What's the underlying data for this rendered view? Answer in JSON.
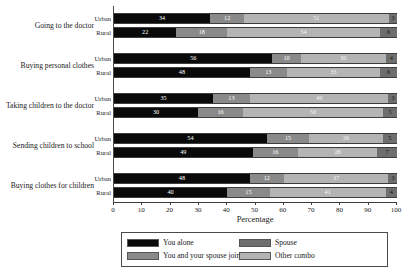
{
  "chart_data": {
    "type": "bar",
    "subtype": "stacked-horizontal-100pct",
    "title": "",
    "xlabel": "Percentage",
    "ylabel": "",
    "xlim": [
      0,
      100
    ],
    "xticks": [
      0,
      10,
      20,
      30,
      40,
      50,
      60,
      70,
      80,
      90,
      100
    ],
    "grid": false,
    "legend_position": "bottom",
    "series": [
      {
        "name": "You alone",
        "color": "#0a0a0a"
      },
      {
        "name": "You and your spouse jointly",
        "color": "#8a8a8a"
      },
      {
        "name": "Spouse",
        "color": "#6e6e6e"
      },
      {
        "name": "Other combo",
        "color": "#b4b4b4"
      }
    ],
    "legend_order_displayed": [
      "You alone",
      "Spouse",
      "You and your spouse jointly",
      "Other combo"
    ],
    "categories": [
      "Going to the doctor",
      "Buying personal clothes",
      "Taking children to the doctor",
      "Sending children to school",
      "Buying clothes for children"
    ],
    "subgroups": [
      "Urban",
      "Rural"
    ],
    "segment_stack_order": [
      "You alone",
      "You and your spouse jointly",
      "Other combo",
      "Spouse"
    ],
    "rows": [
      {
        "category": "Going to the doctor",
        "subgroup": "Urban",
        "values": [
          34,
          12,
          51,
          3
        ]
      },
      {
        "category": "Going to the doctor",
        "subgroup": "Rural",
        "values": [
          22,
          18,
          54,
          6
        ]
      },
      {
        "category": "Buying personal clothes",
        "subgroup": "Urban",
        "values": [
          56,
          10,
          30,
          4
        ]
      },
      {
        "category": "Buying personal clothes",
        "subgroup": "Rural",
        "values": [
          48,
          13,
          33,
          6
        ]
      },
      {
        "category": "Taking children to the doctor",
        "subgroup": "Urban",
        "values": [
          35,
          13,
          49,
          3
        ]
      },
      {
        "category": "Taking children to the doctor",
        "subgroup": "Rural",
        "values": [
          30,
          16,
          50,
          5
        ]
      },
      {
        "category": "Sending children to school",
        "subgroup": "Urban",
        "values": [
          54,
          15,
          26,
          5
        ]
      },
      {
        "category": "Sending children to school",
        "subgroup": "Rural",
        "values": [
          49,
          16,
          28,
          7
        ]
      },
      {
        "category": "Buying clothes for children",
        "subgroup": "Urban",
        "values": [
          48,
          12,
          37,
          3
        ]
      },
      {
        "category": "Buying clothes for children",
        "subgroup": "Rural",
        "values": [
          40,
          15,
          41,
          4
        ]
      }
    ]
  },
  "axis": {
    "title": "Percentage",
    "ticks": [
      "0",
      "10",
      "20",
      "30",
      "40",
      "50",
      "60",
      "70",
      "80",
      "90",
      "100"
    ]
  },
  "legend": {
    "items": [
      {
        "label": "You alone",
        "swatch": "sw0"
      },
      {
        "label": "Spouse",
        "swatch": "sw2"
      },
      {
        "label": "You and your spouse jointly",
        "swatch": "sw1"
      },
      {
        "label": "Other combo",
        "swatch": "sw3"
      }
    ]
  },
  "colors": {
    "you_alone": "#0a0a0a",
    "jointly": "#8a8a8a",
    "spouse": "#6e6e6e",
    "other_combo": "#b4b4b4",
    "axis": "#3d3d3d",
    "panel_bg": "#f2f2f2",
    "page_bg": "#ffffff"
  }
}
